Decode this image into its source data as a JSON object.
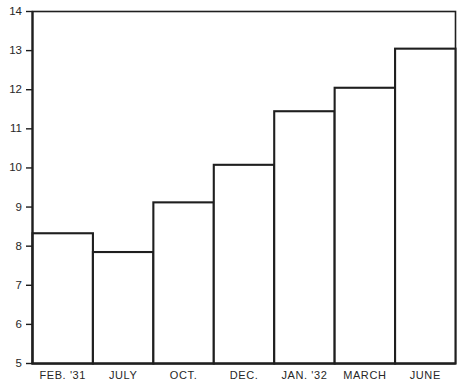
{
  "chart_data": {
    "type": "bar",
    "title": "",
    "subtitle": "",
    "xlabel": "",
    "ylabel": "",
    "categories": [
      "FEB. '31",
      "JULY",
      "OCT.",
      "DEC.",
      "JAN. '32",
      "MARCH",
      "JUNE"
    ],
    "values": [
      8.33,
      7.85,
      9.12,
      10.08,
      11.45,
      12.05,
      13.05
    ],
    "series": [
      {
        "name": "",
        "values": [
          8.33,
          7.85,
          9.12,
          10.08,
          11.45,
          12.05,
          13.05
        ]
      }
    ],
    "ylim": [
      5,
      14
    ],
    "yticks": [
      5,
      6,
      7,
      8,
      9,
      10,
      11,
      12,
      13,
      14
    ],
    "ytick_labels": [
      "5",
      "6",
      "7",
      "8",
      "9",
      "10",
      "11",
      "12",
      "13",
      "14"
    ],
    "grid": false,
    "legend": null,
    "legend_position": "none",
    "bar_style": "outlined-white",
    "colors": {
      "background": "#ffffff",
      "bar_fill": "#ffffff",
      "bar_stroke": "#1f1f1f",
      "axis": "#1c1c1c",
      "text": "#272727"
    }
  }
}
